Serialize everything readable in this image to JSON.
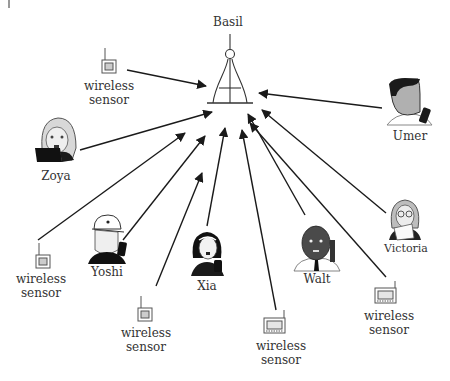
{
  "diagram": {
    "title": "Basil",
    "hub": {
      "label": "Basil",
      "icon": "radio-tower-icon"
    },
    "nodes": [
      {
        "id": "sensor-top",
        "type": "wireless-sensor",
        "label": [
          "wireless",
          "sensor"
        ]
      },
      {
        "id": "umer",
        "type": "person",
        "label": [
          "Umer"
        ]
      },
      {
        "id": "zoya",
        "type": "person",
        "label": [
          "Zoya"
        ]
      },
      {
        "id": "victoria",
        "type": "person",
        "label": [
          "Victoria"
        ]
      },
      {
        "id": "sensor-left",
        "type": "wireless-sensor",
        "label": [
          "wireless",
          "sensor"
        ]
      },
      {
        "id": "yoshi",
        "type": "person",
        "label": [
          "Yoshi"
        ]
      },
      {
        "id": "xia",
        "type": "person",
        "label": [
          "Xia"
        ]
      },
      {
        "id": "walt",
        "type": "person",
        "label": [
          "Walt"
        ]
      },
      {
        "id": "sensor-bottom-left",
        "type": "wireless-sensor",
        "label": [
          "wireless",
          "sensor"
        ]
      },
      {
        "id": "sensor-bottom-mid",
        "type": "wireless-sensor",
        "label": [
          "wireless",
          "sensor"
        ]
      },
      {
        "id": "sensor-right",
        "type": "wireless-sensor",
        "label": [
          "wireless",
          "sensor"
        ]
      }
    ],
    "edges_to_hub": [
      "sensor-top",
      "umer",
      "zoya",
      "victoria",
      "sensor-left",
      "yoshi",
      "xia",
      "walt",
      "sensor-bottom-left",
      "sensor-bottom-mid",
      "sensor-right"
    ]
  },
  "labels": {
    "basil": "Basil",
    "wireless": "wireless",
    "sensor": "sensor",
    "umer": "Umer",
    "zoya": "Zoya",
    "victoria": "Victoria",
    "yoshi": "Yoshi",
    "xia": "Xia",
    "walt": "Walt"
  }
}
